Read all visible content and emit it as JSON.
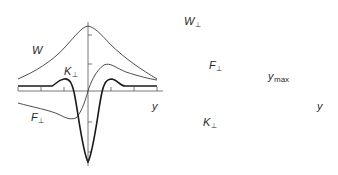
{
  "colors": {
    "background": "#ffffff",
    "axis": "#555555",
    "thin_curve": "#3a3a3a",
    "thick_curve": "#1a1a1a",
    "text": "#2a2a2a",
    "marker": "#000000"
  },
  "panels": [
    {
      "id": "left",
      "origin": [
        88,
        91
      ],
      "axes": {
        "x_range_px": [
          18,
          163
        ],
        "y_range_px": [
          22,
          166
        ],
        "x_ticks_px": [
          18,
          41,
          64,
          111,
          134,
          157
        ],
        "y_ticks_px": [
          35,
          64,
          122,
          152
        ],
        "x_label": "y"
      },
      "labels": {
        "W": "W",
        "K_main": "K",
        "K_sub": "⊥",
        "F_main": "F",
        "F_sub": "⊥",
        "y": "y"
      },
      "curves": [
        {
          "name": "W",
          "style": "thin",
          "description": "Lorentzian-like peak centered at origin, max near axis top, decaying to ~0.2 of peak at edges"
        },
        {
          "name": "K_perp",
          "style": "thin",
          "description": "Antisymmetric dispersion curve: negative minimum left of origin, positive maximum right of origin"
        },
        {
          "name": "F_perp",
          "style": "thick",
          "description": "Deep negative well at origin with small positive shoulders on both sides, flat tails"
        }
      ]
    },
    {
      "id": "right",
      "origin": [
        248,
        91
      ],
      "axes": {
        "x_range_px": [
          180,
          322
        ],
        "y_range_px": [
          6,
          155
        ],
        "x_ticks_px": [
          180,
          203,
          226,
          270,
          293,
          316
        ],
        "y_ticks_px": [
          18,
          70,
          122
        ],
        "x_label": "y"
      },
      "labels": {
        "W_main": "W",
        "W_sub": "⊥",
        "F_main": "F",
        "F_sub": "⊥",
        "ymax_main": "y",
        "ymax_sub": "max",
        "K_main": "K",
        "K_sub": "⊥",
        "y": "y"
      },
      "markers": [
        {
          "name": "y_max_point",
          "px": [
            266,
            92
          ]
        }
      ],
      "curves": [
        {
          "name": "W_perp",
          "style": "thin",
          "description": "Periodic curve with local minimum at origin (~y=43px), maxima near x=210 and x=290"
        },
        {
          "name": "F_perp",
          "style": "thick",
          "description": "Cosine-like oscillation: max at origin, minima near x=205 and x=290"
        },
        {
          "name": "K_perp",
          "style": "thin",
          "description": "Sine-like oscillation: positive hump left of origin, negative trough right of origin, rising at right edge"
        }
      ]
    }
  ]
}
